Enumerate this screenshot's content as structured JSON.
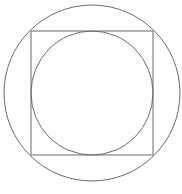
{
  "diagram": {
    "stroke_color": "#6a6a6a",
    "background": "#ffffff",
    "outer_circle": {
      "cx": 92,
      "cy": 93,
      "r": 88
    },
    "square": {
      "x": 31,
      "y": 31,
      "width": 122,
      "height": 124
    },
    "inner_circle": {
      "cx": 92,
      "cy": 93,
      "rx": 61,
      "ry": 62
    }
  }
}
